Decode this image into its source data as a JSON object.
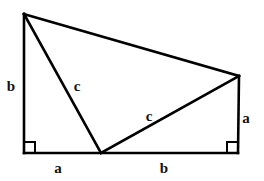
{
  "figure": {
    "kind": "geometry-diagram",
    "background_color": "#ffffff",
    "stroke_color": "#000000",
    "stroke_width": 2.6,
    "canvas": {
      "width": 264,
      "height": 181
    },
    "vertices": {
      "top_left_apex": {
        "x": 24,
        "y": 14
      },
      "bottom_left": {
        "x": 24,
        "y": 153
      },
      "bottom_middle": {
        "x": 101,
        "y": 153
      },
      "bottom_right": {
        "x": 238,
        "y": 153
      },
      "right_upper": {
        "x": 239,
        "y": 76
      }
    },
    "segments": [
      {
        "name": "left-leg-b",
        "from": "top_left_apex",
        "to": "bottom_left"
      },
      {
        "name": "base-a-plus-b",
        "from": "bottom_left",
        "to": "bottom_right"
      },
      {
        "name": "right-leg-a",
        "from": "bottom_right",
        "to": "right_upper"
      },
      {
        "name": "top-hypotenuse-edge",
        "from": "right_upper",
        "to": "top_left_apex"
      },
      {
        "name": "inner-hypotenuse-c-left",
        "from": "top_left_apex",
        "to": "bottom_middle"
      },
      {
        "name": "inner-hypotenuse-c-right",
        "from": "bottom_middle",
        "to": "right_upper"
      }
    ],
    "right_angle_markers": [
      {
        "name": "right-angle-bottom-left",
        "x": 24,
        "y": 153,
        "size": 11,
        "dir_x": 1,
        "dir_y": -1
      },
      {
        "name": "right-angle-bottom-right",
        "x": 238,
        "y": 153,
        "size": 11,
        "dir_x": -1,
        "dir_y": -1
      }
    ],
    "labels": [
      {
        "id": "label-left-b",
        "text": "b",
        "x": 11,
        "y": 86
      },
      {
        "id": "label-inner-c-left",
        "text": "c",
        "x": 77,
        "y": 86
      },
      {
        "id": "label-inner-c-right",
        "text": "c",
        "x": 149,
        "y": 116
      },
      {
        "id": "label-right-a",
        "text": "a",
        "x": 246,
        "y": 118
      },
      {
        "id": "label-base-a",
        "text": "a",
        "x": 58,
        "y": 168
      },
      {
        "id": "label-base-b",
        "text": "b",
        "x": 164,
        "y": 168
      }
    ]
  }
}
